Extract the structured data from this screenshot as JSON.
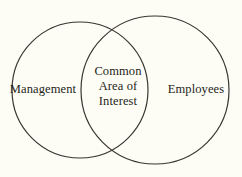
{
  "diagram": {
    "type": "venn",
    "background_color": "#fdfcf5",
    "stroke_color": "#3a3630",
    "text_color": "#241f1a",
    "sets": [
      {
        "id": "left",
        "label": "Management",
        "center_x": 80,
        "center_y": 90,
        "radius": 68
      },
      {
        "id": "right",
        "label": "Employees",
        "center_x": 155,
        "center_y": 90,
        "radius": 74
      }
    ],
    "intersection": {
      "id": "center",
      "lines": [
        "Common",
        "Area of",
        "Interest"
      ],
      "label": "Common Area of Interest"
    }
  }
}
